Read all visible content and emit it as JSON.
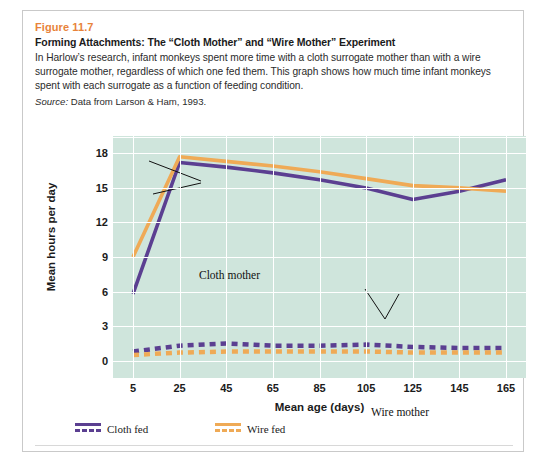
{
  "figure": {
    "number": "Figure 11.7",
    "title": "Forming Attachments: The “Cloth Mother” and “Wire Mother” Experiment",
    "caption_lines": [
      "In Harlow’s research, infant monkeys spent more time with a cloth surrogate mother than with a wire",
      "surrogate mother, regardless of which one fed them. This graph shows how much time infant monkeys",
      "spent with each surrogate as a function of feeding condition."
    ],
    "source_label": "Source:",
    "source_text": " Data from Larson & Ham, 1993."
  },
  "colors": {
    "figure_number": "#e8833a",
    "plot_background": "#cfe5dc",
    "gridline": "#ffffff",
    "cloth_fed": "#5b3f91",
    "wire_fed": "#efaa56",
    "card_border": "#c9c9c9"
  },
  "annotations": [
    {
      "name": "cloth-mother",
      "text": "Cloth mother"
    },
    {
      "name": "wire-mother",
      "text": "Wire mother"
    }
  ],
  "legend": {
    "items": [
      {
        "label": "Cloth fed",
        "color": "#5b3f91"
      },
      {
        "label": "Wire fed",
        "color": "#efaa56"
      }
    ]
  },
  "chart_data": {
    "type": "line",
    "title": "",
    "xlabel": "Mean age (days)",
    "ylabel": "Mean hours per day",
    "x": [
      5,
      25,
      45,
      65,
      85,
      105,
      125,
      145,
      165
    ],
    "xticklabels": [
      "5",
      "25",
      "45",
      "65",
      "85",
      "105",
      "125",
      "145",
      "165"
    ],
    "yticklabels": [
      "0",
      "3",
      "6",
      "9",
      "12",
      "15",
      "18"
    ],
    "yticks": [
      0,
      3,
      6,
      9,
      12,
      15,
      18
    ],
    "xlim": [
      5,
      165
    ],
    "ylim": [
      -1.5,
      19.5
    ],
    "grid": true,
    "legend_position": "below-axes-left",
    "series": [
      {
        "name": "Cloth fed — time with cloth mother",
        "label": "Cloth mother",
        "color": "#5b3f91",
        "style": "solid",
        "values": [
          5.8,
          17.2,
          16.8,
          16.3,
          15.7,
          15.0,
          14.0,
          14.7,
          15.7
        ]
      },
      {
        "name": "Wire fed — time with cloth mother",
        "label": "Cloth mother",
        "color": "#efaa56",
        "style": "solid",
        "values": [
          9.0,
          17.7,
          17.3,
          16.9,
          16.4,
          15.8,
          15.2,
          15.0,
          14.7
        ]
      },
      {
        "name": "Cloth fed — time with wire mother",
        "label": "Wire mother",
        "color": "#5b3f91",
        "style": "dashed",
        "values": [
          0.8,
          1.3,
          1.5,
          1.3,
          1.3,
          1.4,
          1.2,
          1.1,
          1.1
        ]
      },
      {
        "name": "Wire fed — time with wire mother",
        "label": "Wire mother",
        "color": "#efaa56",
        "style": "dashed",
        "values": [
          0.5,
          0.7,
          0.8,
          0.8,
          0.8,
          0.8,
          0.7,
          0.7,
          0.7
        ]
      }
    ]
  }
}
